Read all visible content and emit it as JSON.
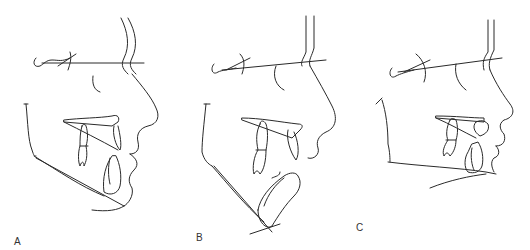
{
  "figure": {
    "type": "cephalometric tracings",
    "panels": [
      {
        "id": "A",
        "label": "A"
      },
      {
        "id": "B",
        "label": "B"
      },
      {
        "id": "C",
        "label": "C"
      }
    ]
  },
  "colors": {
    "line": "#2a2a2a",
    "background": "#ffffff"
  }
}
